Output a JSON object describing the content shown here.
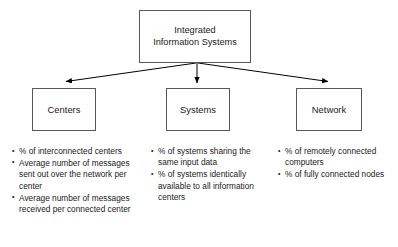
{
  "diagram": {
    "type": "hierarchy-tree",
    "colors": {
      "background": "#ffffff",
      "box_border": "#58585a",
      "text": "#1a1a1a",
      "connector": "#000000"
    },
    "root": {
      "id": "integrated-information-systems",
      "label": "Integrated\nInformation Systems"
    },
    "branches": [
      {
        "id": "centers",
        "label": "Centers",
        "bullets": [
          "% of interconnected centers",
          "Average number of messages sent out over the network per center",
          "Average number of messages received per connected center"
        ]
      },
      {
        "id": "systems",
        "label": "Systems",
        "bullets": [
          "% of systems sharing the same input data",
          "% of systems identically available to all information centers"
        ]
      },
      {
        "id": "network",
        "label": "Network",
        "bullets": [
          "% of remotely connected computers",
          "% of fully connected nodes"
        ]
      }
    ]
  }
}
